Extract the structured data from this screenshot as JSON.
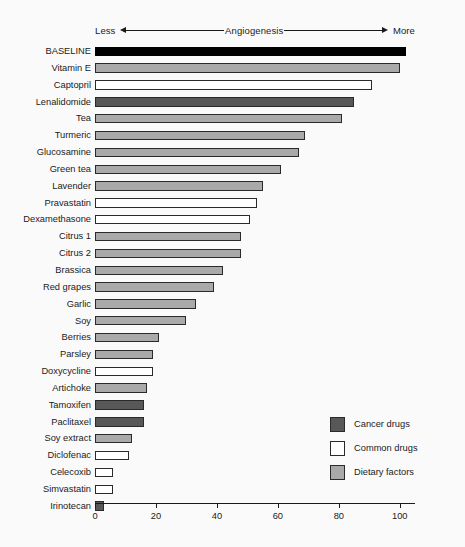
{
  "header": {
    "left_label": "Less",
    "center_label": "Angiogenesis",
    "right_label": "More",
    "left_arrow_icon": "arrow-left-icon",
    "right_arrow_icon": "arrow-right-icon"
  },
  "legend": {
    "position": "bottom-right",
    "items": [
      {
        "label": "Cancer drugs",
        "category": "cancer",
        "color": "#585858"
      },
      {
        "label": "Common drugs",
        "category": "common",
        "color": "#ffffff"
      },
      {
        "label": "Dietary factors",
        "category": "dietary",
        "color": "#a9a9a9"
      }
    ]
  },
  "colors": {
    "background": "#fafafa",
    "ink": "#1a1a1a",
    "baseline": "#000000",
    "cancer_drugs": "#585858",
    "common_drugs": "#ffffff",
    "dietary_factors": "#a9a9a9"
  },
  "chart_data": {
    "type": "bar",
    "orientation": "horizontal",
    "title": "",
    "subtitle": "",
    "xlabel": "Angiogenesis",
    "ylabel": "",
    "xlim": [
      0,
      105
    ],
    "xticks": [
      0,
      20,
      40,
      60,
      80,
      100
    ],
    "xtick_labels": [
      "0",
      "20",
      "40",
      "60",
      "80",
      "100"
    ],
    "grid": false,
    "legend_position": "bottom-right",
    "annotations": [
      "Less",
      "Angiogenesis",
      "More"
    ],
    "categories": [
      "BASELINE",
      "Vitamin E",
      "Captopril",
      "Lenalidomide",
      "Tea",
      "Turmeric",
      "Glucosamine",
      "Green tea",
      "Lavender",
      "Pravastatin",
      "Dexamethasone",
      "Citrus 1",
      "Citrus 2",
      "Brassica",
      "Red grapes",
      "Garlic",
      "Soy",
      "Berries",
      "Parsley",
      "Doxycycline",
      "Artichoke",
      "Tamoxifen",
      "Paclitaxel",
      "Soy extract",
      "Diclofenac",
      "Celecoxib",
      "Simvastatin",
      "Irinotecan"
    ],
    "values": [
      102,
      100,
      91,
      85,
      81,
      69,
      67,
      61,
      55,
      53,
      51,
      48,
      48,
      42,
      39,
      33,
      30,
      21,
      19,
      19,
      17,
      16,
      16,
      12,
      11,
      6,
      6,
      3
    ],
    "groups": [
      "baseline",
      "dietary",
      "common",
      "cancer",
      "dietary",
      "dietary",
      "dietary",
      "dietary",
      "dietary",
      "common",
      "common",
      "dietary",
      "dietary",
      "dietary",
      "dietary",
      "dietary",
      "dietary",
      "dietary",
      "dietary",
      "common",
      "dietary",
      "cancer",
      "cancer",
      "dietary",
      "common",
      "common",
      "common",
      "cancer"
    ]
  }
}
